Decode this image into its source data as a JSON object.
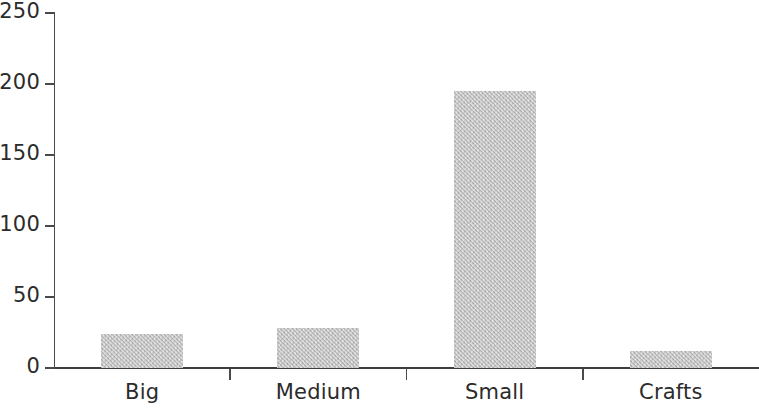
{
  "chart_data": {
    "type": "bar",
    "title": "",
    "subtitle": "",
    "xlabel": "",
    "ylabel": "",
    "categories": [
      "Big",
      "Medium",
      "Small",
      "Crafts"
    ],
    "values": [
      24,
      28,
      195,
      12
    ],
    "series": [
      {
        "name": "",
        "values": [
          24,
          28,
          195,
          12
        ]
      }
    ],
    "ylim": [
      0,
      250
    ],
    "ytick_labels": [
      "0",
      "50",
      "100",
      "150",
      "200",
      "250"
    ],
    "ytick_values": [
      0,
      50,
      100,
      150,
      200,
      250
    ],
    "grid": false,
    "legend": false,
    "legend_position": "none",
    "bar_color": "#c9c9c9",
    "axis_color": "#4a4a4a",
    "text_color": "#2b2b2b",
    "annotations": []
  }
}
